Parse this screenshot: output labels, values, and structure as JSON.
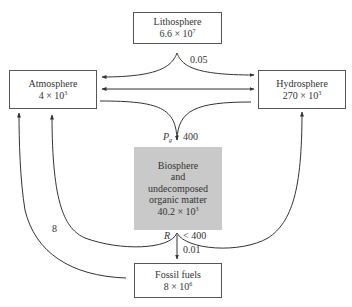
{
  "reservoirs": {
    "lithosphere": {
      "name": "Lithosphere",
      "mantissa": "6.6 × 10",
      "exponent": "7"
    },
    "atmosphere": {
      "name": "Atmosphere",
      "mantissa": "4 × 10",
      "exponent": "3"
    },
    "hydrosphere": {
      "name": "Hydrosphere",
      "mantissa": "270 × 10",
      "exponent": "3"
    },
    "biosphere": {
      "line1": "Biosphere",
      "line2": "and",
      "line3": "undecomposed",
      "line4": "organic matter",
      "mantissa": "40.2 × 10",
      "exponent": "3"
    },
    "fossil_fuels": {
      "name": "Fossil fuels",
      "mantissa": "8 × 10",
      "exponent": "6"
    }
  },
  "fluxes": {
    "lithosphere_out": "0.05",
    "photosynthesis_symbol": "P",
    "photosynthesis_sub": "g",
    "photosynthesis_value": "400",
    "respiration_symbol": "R",
    "respiration_value": "< 400",
    "to_fossil": "0.01",
    "fossil_to_atmosphere": "8"
  },
  "colors": {
    "line": "#333333",
    "box_border": "#555555",
    "biosphere_fill": "#c9c9c9"
  }
}
